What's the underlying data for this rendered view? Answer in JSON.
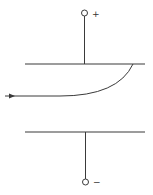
{
  "diagram": {
    "type": "parallel-plate deflection (electron beam between charged plates)",
    "colors": {
      "stroke": "#3a3a3a",
      "background": "#ffffff"
    },
    "top_terminal": {
      "label": "+"
    },
    "bottom_terminal": {
      "label": "−"
    },
    "beam": {
      "direction": "enters from left, curves up toward positive plate"
    }
  }
}
